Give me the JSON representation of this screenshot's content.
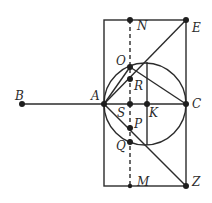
{
  "figure": {
    "points": {
      "A": "A",
      "B": "B",
      "C": "C",
      "E": "E",
      "K": "K",
      "M": "M",
      "N": "N",
      "O": "O",
      "P": "P",
      "Q": "Q",
      "R": "R",
      "S": "S",
      "Z": "Z"
    },
    "segments": [
      "BA",
      "AC",
      "NE",
      "MZ",
      "EZ",
      "AO",
      "AE",
      "AZ",
      "OC",
      "NM (dashed)",
      "K vertical chord"
    ],
    "shapes": [
      "rectangle",
      "circle with diameter AC"
    ]
  }
}
